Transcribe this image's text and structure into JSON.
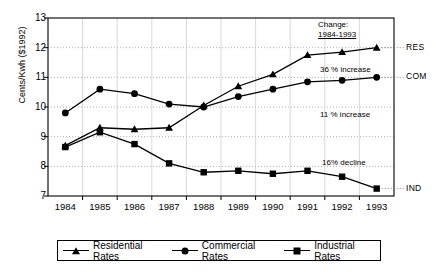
{
  "chart_data": {
    "type": "line",
    "title": "",
    "xlabel": "",
    "ylabel": "Cents/Kwh ($1992)",
    "categories": [
      "1984",
      "1985",
      "1986",
      "1987",
      "1988",
      "1989",
      "1990",
      "1991",
      "1992",
      "1993"
    ],
    "ylim": [
      7,
      13
    ],
    "yticks": [
      7,
      8,
      9,
      10,
      11,
      12,
      13
    ],
    "grid": true,
    "legend_position": "bottom",
    "series": [
      {
        "name": "Residential Rates",
        "marker": "triangle",
        "values": [
          8.7,
          9.3,
          9.25,
          9.3,
          10.05,
          10.7,
          11.1,
          11.75,
          11.85,
          12.0
        ]
      },
      {
        "name": "Commercial Rates",
        "marker": "circle",
        "values": [
          9.8,
          10.6,
          10.45,
          10.1,
          10.0,
          10.35,
          10.6,
          10.85,
          10.9,
          11.0
        ]
      },
      {
        "name": "Industrial Rates",
        "marker": "square",
        "values": [
          8.65,
          9.15,
          8.75,
          8.1,
          7.8,
          7.85,
          7.75,
          7.85,
          7.65,
          7.25
        ]
      }
    ],
    "annotations": [
      {
        "id": "change-header-line1",
        "text": "Change:"
      },
      {
        "id": "change-header-line2",
        "text": "1984-1993"
      },
      {
        "id": "residential-change",
        "text": "36 % increase"
      },
      {
        "id": "commercial-change",
        "text": "11 % increase"
      },
      {
        "id": "industrial-change",
        "text": "16% decline"
      }
    ],
    "series_end_labels": [
      {
        "id": "res",
        "text": "RES"
      },
      {
        "id": "com",
        "text": "COM"
      },
      {
        "id": "ind",
        "text": "IND"
      }
    ],
    "colors": {
      "line": "#000000",
      "marker": "#000000",
      "grid": "#9a9a9a",
      "axis": "#000000",
      "background": "#ffffff"
    }
  }
}
